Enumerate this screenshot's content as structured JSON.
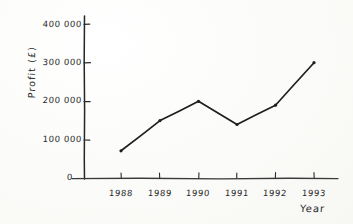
{
  "chart_data": {
    "type": "line",
    "title": "",
    "xlabel": "Year",
    "ylabel": "Profit (£)",
    "categories": [
      "1988",
      "1989",
      "1990",
      "1991",
      "1992",
      "1993"
    ],
    "values": [
      72000,
      150000,
      200000,
      140000,
      190000,
      300000
    ],
    "series": [
      {
        "name": "Profit",
        "values": [
          72000,
          150000,
          200000,
          140000,
          190000,
          300000
        ]
      }
    ],
    "ylim": [
      0,
      400000
    ],
    "y_ticks": [
      0,
      100000,
      200000,
      300000,
      400000
    ],
    "y_tick_labels": [
      "0",
      "100 000",
      "200 000",
      "300 000",
      "400 000"
    ],
    "x_ticks": [
      "1988",
      "1989",
      "1990",
      "1991",
      "1992",
      "1993"
    ],
    "grid": false,
    "legend": false,
    "legend_position": "none",
    "style": "hand-drawn",
    "line_color": "#1e1e1e",
    "marker": "dot",
    "background_color": "#fdfdfb"
  },
  "axes": {
    "y_title": "Profit (£)",
    "x_title": "Year",
    "y_tick_labels": [
      "400 000",
      "300 000",
      "200 000",
      "100 000",
      "0"
    ],
    "x_tick_labels": [
      "1988",
      "1989",
      "1990",
      "1991",
      "1992",
      "1993"
    ]
  }
}
